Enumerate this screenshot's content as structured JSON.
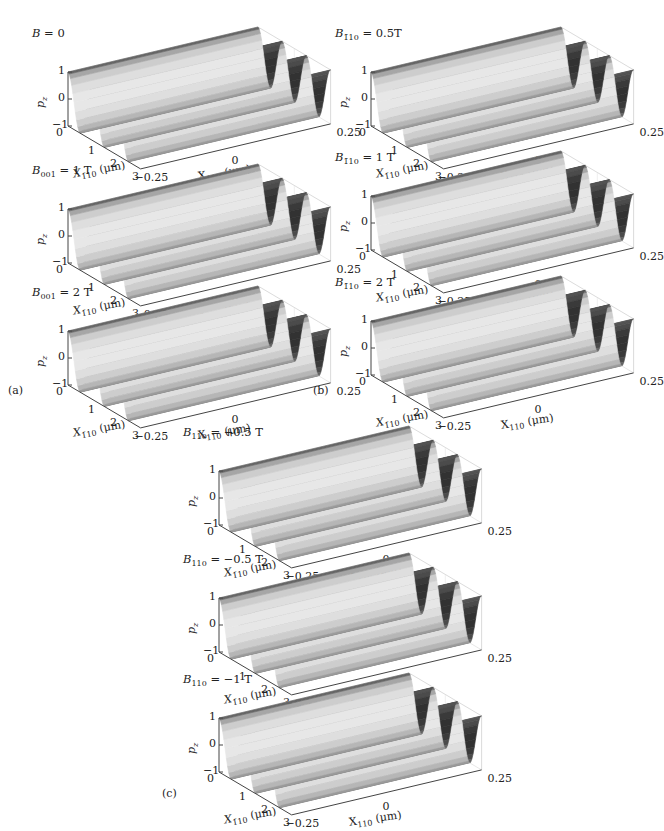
{
  "chart_data": [
    {
      "type": "surface3d",
      "panel": "a",
      "title_sym": "B",
      "title_sub": "",
      "title_val": "= 0",
      "zlabel": "p_z",
      "zticks": [
        "1",
        "0",
        "−1"
      ],
      "xlabel": "X_1̄10 (μm)",
      "xticks": [
        "0",
        "1",
        "2",
        "3"
      ],
      "ylabel": "X_110 (μm)",
      "yticks": [
        "−0.25",
        "0",
        "0.25"
      ],
      "ridges": 3,
      "zlim": [
        -1,
        1
      ],
      "xlim": [
        0,
        3
      ],
      "ylim": [
        -0.25,
        0.25
      ]
    },
    {
      "type": "surface3d",
      "panel": "a",
      "title_sym": "B",
      "title_sub": "001",
      "title_val": "= 1 T",
      "zlabel": "p_z",
      "zticks": [
        "1",
        "0",
        "−1"
      ],
      "xlabel": "X_1̄10 (μm)",
      "xticks": [
        "0",
        "1",
        "2",
        "3"
      ],
      "ylabel": "X_110 (μm)",
      "yticks": [
        "−0.25",
        "0",
        "0.25"
      ],
      "ridges": 3,
      "zlim": [
        -1,
        1
      ],
      "xlim": [
        0,
        3
      ],
      "ylim": [
        -0.25,
        0.25
      ]
    },
    {
      "type": "surface3d",
      "panel": "a",
      "title_sym": "B",
      "title_sub": "001",
      "title_val": "= 2 T",
      "zlabel": "p_z",
      "zticks": [
        "1",
        "0",
        "−1"
      ],
      "xlabel": "X_1̄10 (μm)",
      "xticks": [
        "0",
        "1",
        "2",
        "3"
      ],
      "ylabel": "X_110 (μm)",
      "yticks": [
        "−0.25",
        "0",
        "0.25"
      ],
      "ridges": 3,
      "zlim": [
        -1,
        1
      ],
      "xlim": [
        0,
        3
      ],
      "ylim": [
        -0.25,
        0.25
      ]
    },
    {
      "type": "surface3d",
      "panel": "b",
      "title_sym": "B",
      "title_sub": "1̄10",
      "title_val": "= 0.5T",
      "zlabel": "p_z",
      "zticks": [
        "1",
        "0",
        "−1"
      ],
      "xlabel": "X_1̄10 (μm)",
      "xticks": [
        "0",
        "1",
        "2",
        "3"
      ],
      "ylabel": "X_110 (μm)",
      "yticks": [
        "−0.25",
        "0",
        "0.25"
      ],
      "ridges": 3,
      "zlim": [
        -1,
        1
      ],
      "xlim": [
        0,
        3
      ],
      "ylim": [
        -0.25,
        0.25
      ]
    },
    {
      "type": "surface3d",
      "panel": "b",
      "title_sym": "B",
      "title_sub": "1̄10",
      "title_val": "= 1 T",
      "zlabel": "p_z",
      "zticks": [
        "1",
        "0",
        "−1"
      ],
      "xlabel": "X_1̄10 (μm)",
      "xticks": [
        "0",
        "1",
        "2",
        "3"
      ],
      "ylabel": "X_110 (μm)",
      "yticks": [
        "−0.25",
        "0",
        "0.25"
      ],
      "ridges": 3,
      "zlim": [
        -1,
        1
      ],
      "xlim": [
        0,
        3
      ],
      "ylim": [
        -0.25,
        0.25
      ]
    },
    {
      "type": "surface3d",
      "panel": "b",
      "title_sym": "B",
      "title_sub": "1̄10",
      "title_val": "= 2 T",
      "zlabel": "p_z",
      "zticks": [
        "1",
        "0",
        "−1"
      ],
      "xlabel": "X_1̄10 (μm)",
      "xticks": [
        "0",
        "1",
        "2",
        "3"
      ],
      "ylabel": "X_110 (μm)",
      "yticks": [
        "−0.25",
        "0",
        "0.25"
      ],
      "ridges": 3,
      "zlim": [
        -1,
        1
      ],
      "xlim": [
        0,
        3
      ],
      "ylim": [
        -0.25,
        0.25
      ]
    },
    {
      "type": "surface3d",
      "panel": "c",
      "title_sym": "B",
      "title_sub": "110",
      "title_val": "= +0.5 T",
      "zlabel": "p_z",
      "zticks": [
        "1",
        "0",
        "−1"
      ],
      "xlabel": "X_1̄10 (μm)",
      "xticks": [
        "0",
        "1",
        "2",
        "3"
      ],
      "ylabel": "X_110 (μm)",
      "yticks": [
        "−0.25",
        "0",
        "0.25"
      ],
      "ridges": 3,
      "zlim": [
        -1,
        1
      ],
      "xlim": [
        0,
        3
      ],
      "ylim": [
        -0.25,
        0.25
      ]
    },
    {
      "type": "surface3d",
      "panel": "c",
      "title_sym": "B",
      "title_sub": "110",
      "title_val": "= −0.5 T",
      "zlabel": "p_z",
      "zticks": [
        "1",
        "0",
        "−1"
      ],
      "xlabel": "X_1̄10 (μm)",
      "xticks": [
        "0",
        "1",
        "2",
        "3"
      ],
      "ylabel": "X_110 (μm)",
      "yticks": [
        "−0.25",
        "0",
        "0.25"
      ],
      "ridges": 3,
      "zlim": [
        -1,
        1
      ],
      "xlim": [
        0,
        3
      ],
      "ylim": [
        -0.25,
        0.25
      ]
    },
    {
      "type": "surface3d",
      "panel": "c",
      "title_sym": "B",
      "title_sub": "110",
      "title_val": "= −1 T",
      "zlabel": "p_z",
      "zticks": [
        "1",
        "0",
        "−1"
      ],
      "xlabel": "X_1̄10 (μm)",
      "xticks": [
        "0",
        "1",
        "2",
        "3"
      ],
      "ylabel": "X_110 (μm)",
      "yticks": [
        "−0.25",
        "0",
        "0.25"
      ],
      "ridges": 3,
      "zlim": [
        -1,
        1
      ],
      "xlim": [
        0,
        3
      ],
      "ylim": [
        -0.25,
        0.25
      ]
    }
  ],
  "panel_labels": [
    "(a)",
    "(b)",
    "(c)"
  ],
  "axes": {
    "z_sym": "p",
    "z_sub": "z",
    "x_sym": "X",
    "x_sub": "1̄10",
    "x_unit": " (μm)",
    "y_sym": "X",
    "y_sub": "110",
    "y_unit": " (μm)",
    "zticks": [
      "1",
      "0",
      "−1"
    ],
    "xticks": [
      "0",
      "1",
      "2",
      "3"
    ],
    "yticks": [
      "−0.25",
      "0",
      "0.25"
    ]
  }
}
